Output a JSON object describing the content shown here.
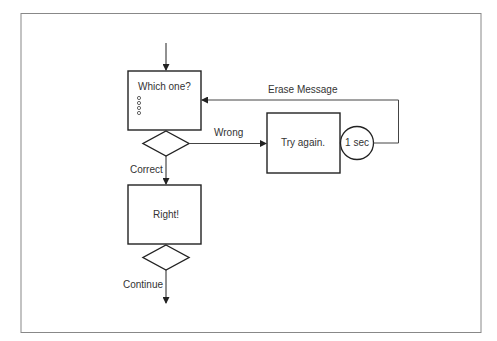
{
  "diagram": {
    "type": "flowchart",
    "colors": {
      "stroke": "#222222",
      "frame": "#777777",
      "text": "#333333",
      "background": "#ffffff"
    },
    "nodes": {
      "question_box": {
        "label": "Which one?",
        "options_icon": "radio-options-icon",
        "option_count": 4
      },
      "decision_1": {
        "shape": "diamond"
      },
      "try_again_box": {
        "label": "Try again."
      },
      "timer": {
        "label": "1 sec",
        "shape": "circle"
      },
      "right_box": {
        "label": "Right!"
      },
      "decision_2": {
        "shape": "diamond"
      }
    },
    "edges": {
      "wrong": {
        "label": "Wrong"
      },
      "erase": {
        "label": "Erase Message"
      },
      "correct": {
        "label": "Correct"
      },
      "continue": {
        "label": "Continue"
      }
    }
  }
}
